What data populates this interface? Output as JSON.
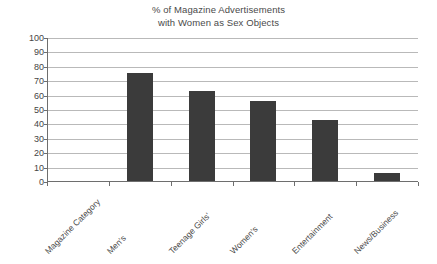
{
  "chart_data": {
    "type": "bar",
    "title": "% of Magazine Advertisements with Women as Sex Objects",
    "title_lines": [
      "% of Magazine Advertisements",
      "with Women as Sex Objects"
    ],
    "xlabel": "Magazine Category",
    "ylabel": "",
    "categories": [
      "Men's",
      "Teenage Girls'",
      "Women's",
      "Entertainment",
      "News/Business"
    ],
    "values": [
      76,
      63,
      56,
      43,
      6
    ],
    "ylim": [
      0,
      100
    ],
    "ytick_labels": [
      "100",
      "90",
      "80",
      "70",
      "60",
      "50",
      "40",
      "30",
      "20",
      "10",
      "0"
    ],
    "ytick_values": [
      100,
      90,
      80,
      70,
      60,
      50,
      40,
      30,
      20,
      10,
      0
    ],
    "grid": "horizontal",
    "legend": "none",
    "bar_color": "#3b3b3b",
    "grid_color": "#b9b9b9",
    "axis_color": "#6e6e6e",
    "text_color": "#4a4a4a",
    "xtick_slots": [
      "Magazine Category",
      "Men's",
      "Teenage Girls'",
      "Women's",
      "Entertainment",
      "News/Business"
    ]
  }
}
